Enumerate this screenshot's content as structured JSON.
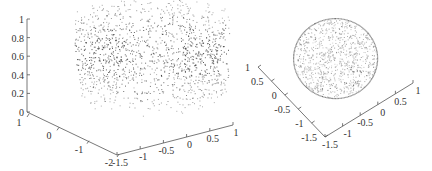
{
  "chart_data": [
    {
      "type": "scatter",
      "subtype": "3d-point-cloud",
      "title": "",
      "description": "Cylindrical shell of points in 3D, radius ~1, z from 0 to 1, denser in middle band",
      "axes": {
        "z": {
          "label": "",
          "ticks": [
            "0",
            "0.2",
            "0.4",
            "0.6",
            "0.8",
            "1"
          ],
          "range": [
            0,
            1
          ]
        },
        "x": {
          "label": "",
          "ticks": [
            "1",
            "0",
            "-1",
            "-2"
          ],
          "range": [
            -2,
            1
          ]
        },
        "y": {
          "label": "",
          "ticks": [
            "-1.5",
            "-1",
            "-0.5",
            "0",
            "0.5",
            "1"
          ],
          "range": [
            -1.5,
            1
          ]
        }
      },
      "grid": false,
      "legend": null
    },
    {
      "type": "scatter",
      "subtype": "3d-point-cloud-top-view",
      "title": "",
      "description": "Disk-shaped point cloud viewed from above, radius ~1",
      "axes": {
        "x": {
          "label": "",
          "ticks": [
            "1",
            "0.5",
            "0",
            "-0.5",
            "-1",
            "-1.5"
          ],
          "range": [
            -1.5,
            1
          ]
        },
        "y": {
          "label": "",
          "ticks": [
            "-1.5",
            "-1",
            "-0.5",
            "0",
            "0.5",
            "1"
          ],
          "range": [
            -1.5,
            1
          ]
        }
      },
      "grid": false,
      "legend": null
    }
  ],
  "left": {
    "z_ticks": [
      "0",
      "0.2",
      "0.4",
      "0.6",
      "0.8",
      "1"
    ],
    "x_ticks": [
      "1",
      "0",
      "-1",
      "-2"
    ],
    "y_ticks": [
      "-1.5",
      "-1",
      "-0.5",
      "0",
      "0.5",
      "1"
    ]
  },
  "right": {
    "x_ticks": [
      "1",
      "0.5",
      "0",
      "-0.5",
      "-1",
      "-1.5"
    ],
    "y_ticks": [
      "-1.5",
      "-1",
      "-0.5",
      "0",
      "0.5",
      "1"
    ]
  },
  "colors": {
    "axis": "#555555",
    "points": "#444444"
  }
}
